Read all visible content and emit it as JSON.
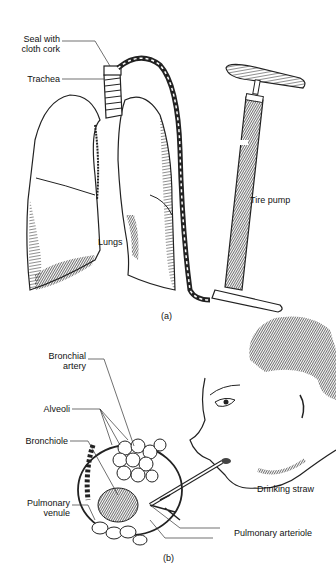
{
  "figure_a": {
    "caption": "(a)",
    "labels": {
      "seal_line1": "Seal with",
      "seal_line2": "cloth cork",
      "trachea": "Trachea",
      "lungs": "Lungs",
      "tire_pump": "Tire pump"
    }
  },
  "figure_b": {
    "caption": "(b)",
    "labels": {
      "bronchial_line1": "Bronchial",
      "bronchial_line2": "artery",
      "alveoli": "Alveoli",
      "bronchiole": "Bronchiole",
      "venule_line1": "Pulmonary",
      "venule_line2": "venule",
      "drinking_straw": "Drinking straw",
      "pulmonary_arteriole": "Pulmonary arteriole"
    }
  }
}
